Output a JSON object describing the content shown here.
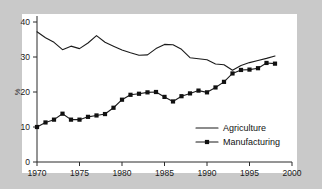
{
  "chart_data": {
    "type": "line",
    "title": "",
    "subtitle": "",
    "xlabel": "",
    "ylabel": "%",
    "xlim": [
      1970,
      2000
    ],
    "ylim": [
      0,
      40
    ],
    "xticks": [
      1970,
      1975,
      1980,
      1985,
      1990,
      1995,
      2000
    ],
    "xticklabels": [
      "1970",
      "1975",
      "1980",
      "1985",
      "1990",
      "1995",
      "2000"
    ],
    "yticks": [
      0,
      10,
      20,
      30,
      40
    ],
    "yticklabels": [
      "0",
      "10",
      "20",
      "30",
      "40"
    ],
    "grid": false,
    "legend_position": "lower-right",
    "x": [
      1970,
      1971,
      1972,
      1973,
      1974,
      1975,
      1976,
      1977,
      1978,
      1979,
      1980,
      1981,
      1982,
      1983,
      1984,
      1985,
      1986,
      1987,
      1988,
      1989,
      1990,
      1991,
      1992,
      1993,
      1994,
      1995,
      1996,
      1997,
      1998
    ],
    "series": [
      {
        "name": "Agriculture",
        "marker": "none",
        "values": [
          37.2,
          35.5,
          34.2,
          32.1,
          33.1,
          32.4,
          34.0,
          36.1,
          34.2,
          33.1,
          32.0,
          31.2,
          30.5,
          30.6,
          32.4,
          33.6,
          33.5,
          32.2,
          29.8,
          29.5,
          29.2,
          28.0,
          27.8,
          26.2,
          27.6,
          28.4,
          29.0,
          29.6,
          30.3
        ]
      },
      {
        "name": "Manufacturing",
        "marker": "square",
        "values": [
          10.0,
          11.3,
          12.1,
          13.8,
          12.1,
          12.1,
          12.9,
          13.3,
          13.7,
          15.5,
          17.8,
          19.2,
          19.5,
          19.9,
          20.0,
          18.6,
          17.3,
          18.8,
          19.6,
          20.4,
          19.9,
          21.3,
          22.9,
          25.3,
          26.3,
          26.4,
          26.8,
          28.3,
          28.1
        ]
      }
    ],
    "legend": [
      {
        "label": "Agriculture",
        "marker": "none"
      },
      {
        "label": "Manufacturing",
        "marker": "square"
      }
    ]
  },
  "colors": {
    "background": "#c9c9c9",
    "panel": "#ffffff",
    "axis": "#2b2b2b",
    "series": "#111111"
  }
}
